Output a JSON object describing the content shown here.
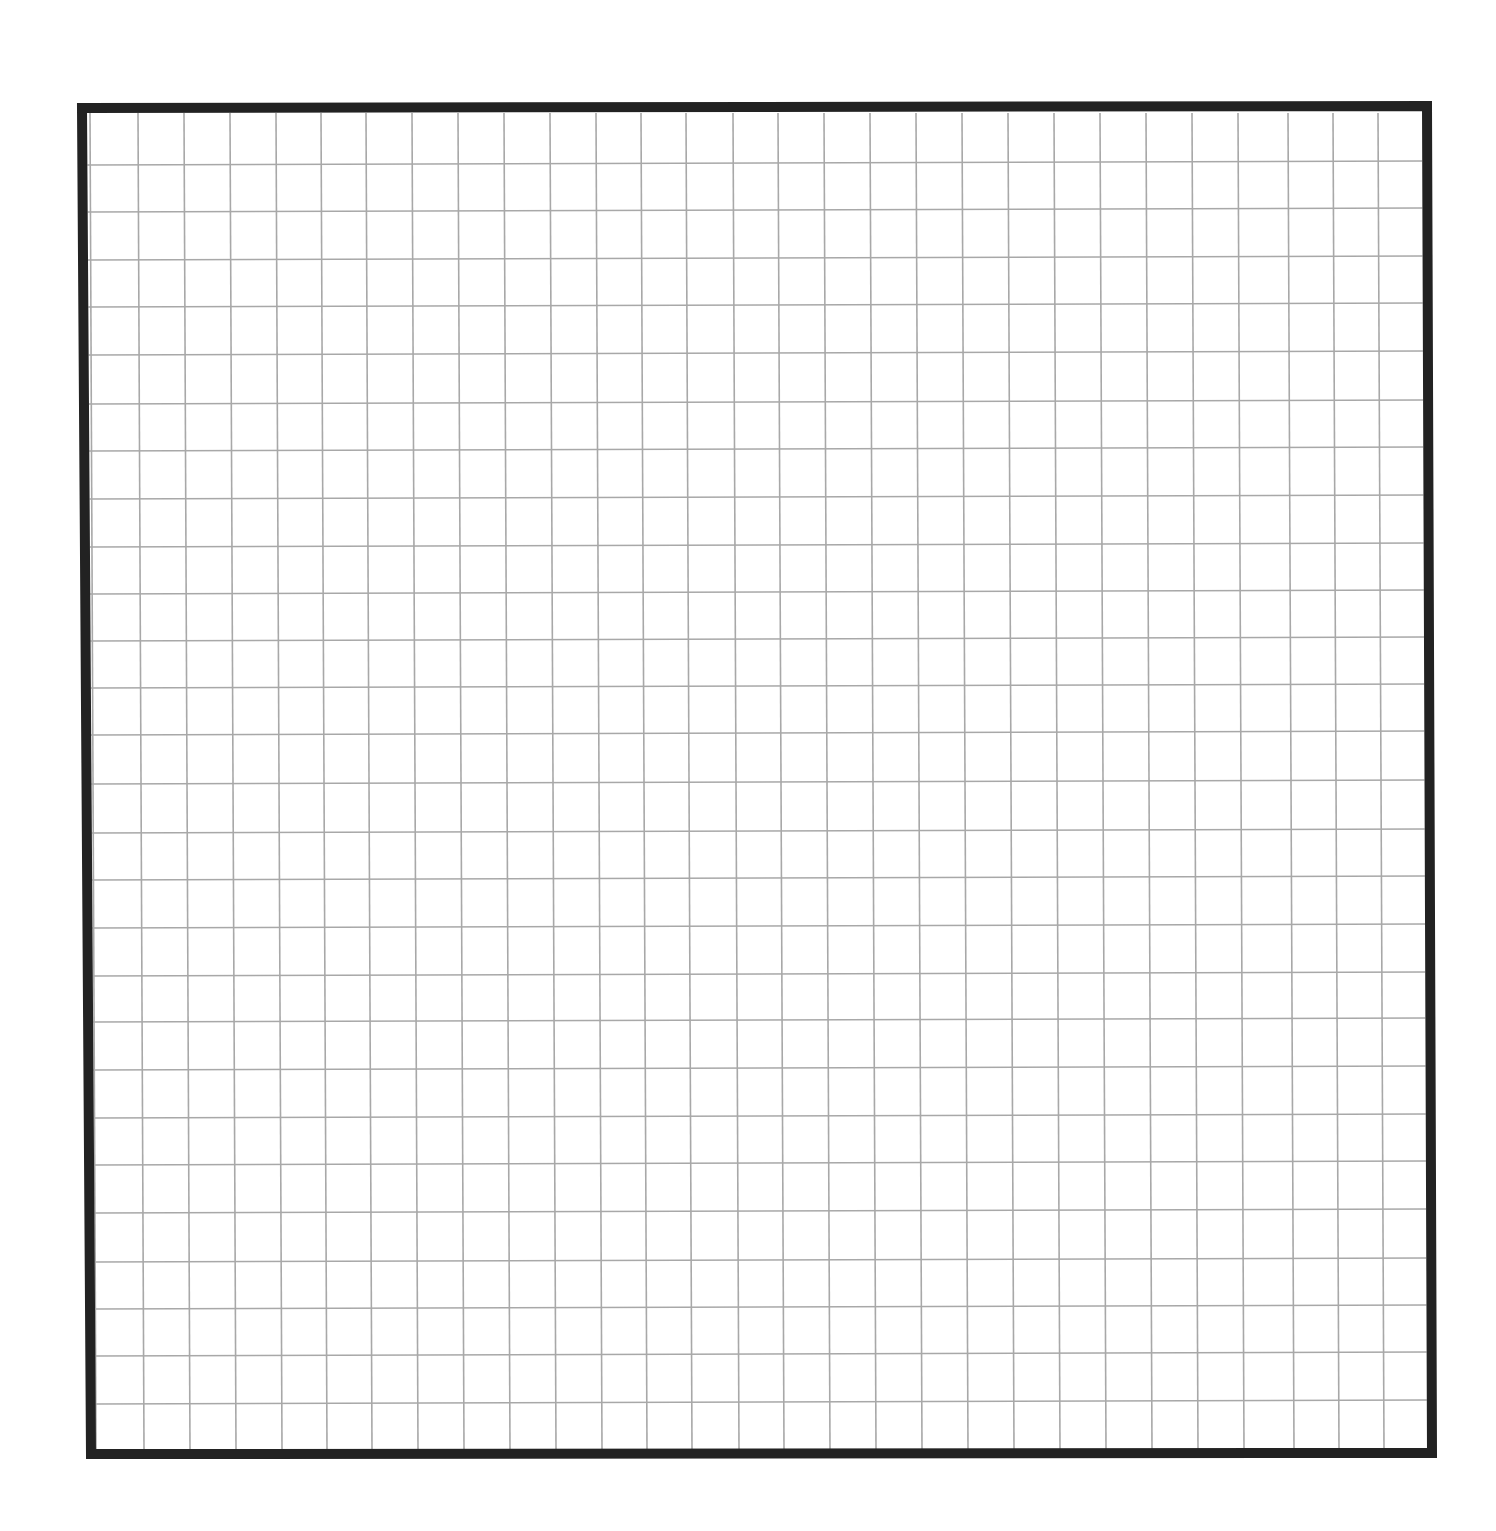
{
  "page": {
    "width": 1496,
    "height": 1531,
    "background": "#ffffff"
  },
  "grid": {
    "description": "Blank graph-paper grid inside a thick black frame",
    "frame": {
      "top_left": [
        82,
        108
      ],
      "top_right": [
        1427,
        106
      ],
      "bottom_right": [
        1432,
        1453
      ],
      "bottom_left": [
        91,
        1454
      ],
      "stroke_width": 10,
      "color": "#222222"
    },
    "lines": {
      "color": "#a8a8a8",
      "stroke_width": 1.6,
      "vertical_x_top": [
        90,
        138,
        184,
        230,
        276,
        321,
        366,
        412,
        458,
        504,
        550,
        596,
        641,
        686,
        733,
        778,
        824,
        870,
        916,
        962,
        1008,
        1054,
        1100,
        1146,
        1192,
        1238,
        1288,
        1333,
        1378
      ],
      "vertical_skew_bottom": 6,
      "horizontal_y_left": [
        165,
        212,
        260,
        307,
        355,
        404,
        451,
        499,
        547,
        594,
        641,
        688,
        735,
        784,
        833,
        880,
        928,
        976,
        1022,
        1070,
        1118,
        1165,
        1213,
        1262,
        1309,
        1356,
        1404
      ],
      "horizontal_skew_right": -4
    },
    "columns_visible": 29,
    "rows_visible": 28,
    "cell_width_px": 45.9,
    "cell_height_px": 47.6
  }
}
